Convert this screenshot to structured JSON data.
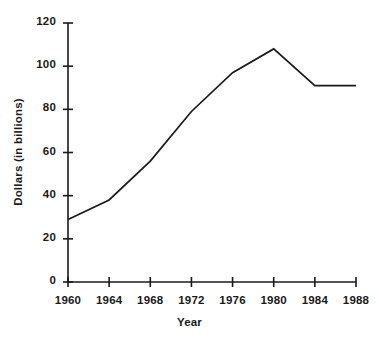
{
  "chart_data": {
    "type": "line",
    "title": "",
    "xlabel": "Year",
    "ylabel": "Dollars (in billions)",
    "x": [
      1960,
      1964,
      1968,
      1972,
      1976,
      1980,
      1984,
      1988
    ],
    "values": [
      29,
      38,
      56,
      79,
      97,
      108,
      91,
      91
    ],
    "series": [
      {
        "name": "Dollars (in billions)",
        "values": [
          29,
          38,
          56,
          79,
          97,
          108,
          91,
          91
        ]
      }
    ],
    "xtick_labels": [
      "1960",
      "1964",
      "1968",
      "1972",
      "1976",
      "1980",
      "1984",
      "1988"
    ],
    "ytick_labels": [
      "0",
      "20",
      "40",
      "60",
      "80",
      "100",
      "120"
    ],
    "yticks": [
      0,
      20,
      40,
      60,
      80,
      100,
      120
    ],
    "xlim": [
      1960,
      1988
    ],
    "ylim": [
      0,
      120
    ],
    "grid": false,
    "legend": false,
    "legend_position": "none",
    "line_color": "#1a1a1a",
    "axis_color": "#1a1a1a",
    "background_color": "#ffffff"
  }
}
